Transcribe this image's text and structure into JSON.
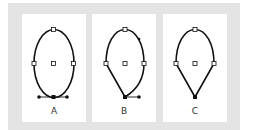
{
  "figure": {
    "background_color": "#e4e4e4",
    "panel_color": "#ffffff",
    "stroke_color": "#111111",
    "panels": [
      {
        "label": "A",
        "description": "Smooth oval path with bottom anchor showing two direction handles"
      },
      {
        "label": "B",
        "description": "Path with bottom anchor converted: left segment straight, right segment curved with one handle"
      },
      {
        "label": "C",
        "description": "Path with bottom corner point: both lower segments straight"
      }
    ]
  }
}
